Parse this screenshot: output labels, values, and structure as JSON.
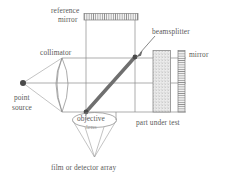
{
  "figure": {
    "background_color": "#ffffff",
    "line_color": "#8a8a8a",
    "text_color": "#5a5a5a",
    "accent_color": "#6f6f6f",
    "width": 226,
    "height": 179
  },
  "labels": {
    "reference_mirror_line1": "reference",
    "reference_mirror_line2": "mirror",
    "beamsplitter": "beamsplitter",
    "mirror": "mirror",
    "collimator": "collimator",
    "point_source_line1": "point",
    "point_source_line2": "source",
    "objective_lens_line1": "objective",
    "objective_lens_line2": "lens",
    "part_under_test": "part under test",
    "detector": "film or detector array"
  },
  "components": [
    {
      "name": "point-source",
      "kind": "dot",
      "label": "point source"
    },
    {
      "name": "collimator-lens",
      "kind": "biconvex-lens",
      "label": "collimator"
    },
    {
      "name": "beamsplitter",
      "kind": "diagonal-plate",
      "label": "beamsplitter"
    },
    {
      "name": "reference-mirror",
      "kind": "hatched-bar-horizontal",
      "label": "reference mirror"
    },
    {
      "name": "part-under-test",
      "kind": "stippled-block",
      "label": "part under test"
    },
    {
      "name": "return-mirror",
      "kind": "hatched-bar-vertical",
      "label": "mirror"
    },
    {
      "name": "objective-lens",
      "kind": "ellipse-lens",
      "label": "objective lens"
    },
    {
      "name": "detector-array",
      "kind": "cone-apex",
      "label": "film or detector array"
    }
  ],
  "beams": {
    "upper_y": 58,
    "axis_y": 83,
    "lower_y": 112,
    "left_node_x": 86,
    "right_node_x": 135,
    "source_x": 23,
    "detector_apex_y": 157
  }
}
